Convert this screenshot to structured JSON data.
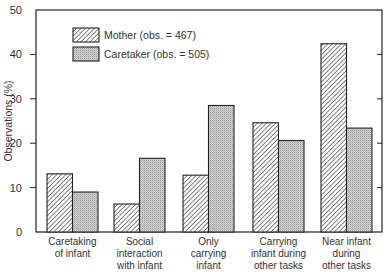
{
  "chart_data": {
    "type": "bar",
    "title": "",
    "xlabel": "",
    "ylabel": "Observations (%)",
    "ylim": [
      0,
      50
    ],
    "yticks": [
      0,
      10,
      20,
      30,
      40,
      50
    ],
    "grid": false,
    "legend_position": "upper-left",
    "categories": [
      [
        "Caretaking",
        "of infant"
      ],
      [
        "Social",
        "interaction",
        "with infant"
      ],
      [
        "Only",
        "carrying",
        "infant"
      ],
      [
        "Carrying",
        "infant during",
        "other tasks"
      ],
      [
        "Near infant",
        "during",
        "other tasks"
      ]
    ],
    "series": [
      {
        "name": "Mother (obs. = 467)",
        "pattern": "diagonal-hatch",
        "values": [
          13.1,
          6.3,
          12.8,
          24.6,
          42.4
        ]
      },
      {
        "name": "Caretaker (obs. = 505)",
        "pattern": "stipple-gray",
        "values": [
          9.0,
          16.6,
          28.5,
          20.6,
          23.4
        ]
      }
    ]
  }
}
